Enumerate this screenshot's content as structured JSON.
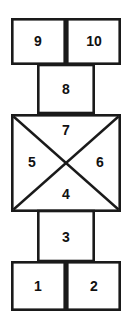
{
  "diagram": {
    "type": "hopscotch-court",
    "stroke_color": "#1a1a1a",
    "fill_color": "#ffffff",
    "label_color": "#111111",
    "cells": [
      {
        "id": "cell-9",
        "label": "9",
        "shape": "rectangle",
        "x": 11,
        "y": 18,
        "w": 55,
        "h": 47,
        "label_x": 38,
        "label_y": 42
      },
      {
        "id": "cell-10",
        "label": "10",
        "shape": "rectangle",
        "x": 66,
        "y": 18,
        "w": 55,
        "h": 47,
        "label_x": 94,
        "label_y": 42
      },
      {
        "id": "cell-8",
        "label": "8",
        "shape": "rectangle",
        "x": 37,
        "y": 65,
        "w": 58,
        "h": 49,
        "label_x": 66,
        "label_y": 90
      },
      {
        "id": "cell-3",
        "label": "3",
        "shape": "rectangle",
        "x": 37,
        "y": 212,
        "w": 58,
        "h": 50,
        "label_x": 66,
        "label_y": 238
      },
      {
        "id": "cell-1",
        "label": "1",
        "shape": "rectangle",
        "x": 11,
        "y": 262,
        "w": 55,
        "h": 49,
        "label_x": 38,
        "label_y": 287
      },
      {
        "id": "cell-2",
        "label": "2",
        "shape": "rectangle",
        "x": 66,
        "y": 262,
        "w": 55,
        "h": 49,
        "label_x": 94,
        "label_y": 287
      }
    ],
    "square": {
      "id": "cell-square",
      "x": 11,
      "y": 114,
      "w": 110,
      "h": 98,
      "center_x": 66,
      "center_y": 163,
      "triangles": [
        {
          "id": "cell-7",
          "label": "7",
          "position": "top",
          "label_x": 66,
          "label_y": 131
        },
        {
          "id": "cell-5",
          "label": "5",
          "position": "left",
          "label_x": 32,
          "label_y": 163
        },
        {
          "id": "cell-6",
          "label": "6",
          "position": "right",
          "label_x": 100,
          "label_y": 163
        },
        {
          "id": "cell-4",
          "label": "4",
          "position": "bottom",
          "label_x": 66,
          "label_y": 195
        }
      ]
    }
  }
}
